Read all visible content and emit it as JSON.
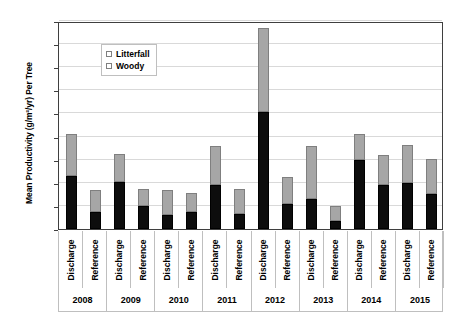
{
  "chart_data": {
    "type": "bar",
    "subtype": "stacked-column",
    "title": "",
    "xlabel": "",
    "ylabel": "Mean Productivity (g/m²/yr) Per Tree",
    "ylim": [
      0,
      180
    ],
    "ytick_step": 20,
    "yticks": [
      0,
      20,
      40,
      60,
      80,
      100,
      120,
      140,
      160,
      180
    ],
    "ytick_labels": [
      "0",
      "20",
      "40",
      "60",
      "80",
      "100",
      "120",
      "140",
      "160",
      "180"
    ],
    "grid": true,
    "grid_axis": "y",
    "legend": {
      "position": "upper-left-inside",
      "entries": [
        {
          "name": "Litterfall",
          "color": "#a6a6a6"
        },
        {
          "name": "Woody",
          "color": "#0d0d0d"
        }
      ]
    },
    "groups": [
      "2008",
      "2009",
      "2010",
      "2011",
      "2012",
      "2013",
      "2014",
      "2015"
    ],
    "categories": [
      "Discharge",
      "Reference",
      "Discharge",
      "Reference",
      "Discharge",
      "Reference",
      "Discharge",
      "Reference",
      "Discharge",
      "Reference",
      "Discharge",
      "Reference",
      "Discharge",
      "Reference",
      "Discharge",
      "Reference"
    ],
    "series": [
      {
        "name": "Woody",
        "color": "#0d0d0d",
        "values": [
          46,
          15,
          41,
          20,
          12,
          15,
          38,
          13,
          101,
          22,
          26,
          7,
          60,
          38,
          40,
          30
        ]
      },
      {
        "name": "Litterfall",
        "color": "#a6a6a6",
        "values": [
          36,
          19,
          24,
          15,
          22,
          16,
          34,
          22,
          73,
          23,
          46,
          13,
          22,
          26,
          33,
          31
        ]
      }
    ],
    "totals": [
      82,
      34,
      65,
      35,
      34,
      31,
      72,
      35,
      174,
      45,
      72,
      20,
      82,
      64,
      73,
      61
    ],
    "bars": [
      {
        "group": "2008",
        "category": "Discharge",
        "woody": 46,
        "litterfall": 36,
        "total": 82
      },
      {
        "group": "2008",
        "category": "Reference",
        "woody": 15,
        "litterfall": 19,
        "total": 34
      },
      {
        "group": "2009",
        "category": "Discharge",
        "woody": 41,
        "litterfall": 24,
        "total": 65
      },
      {
        "group": "2009",
        "category": "Reference",
        "woody": 20,
        "litterfall": 15,
        "total": 35
      },
      {
        "group": "2010",
        "category": "Discharge",
        "woody": 12,
        "litterfall": 22,
        "total": 34
      },
      {
        "group": "2010",
        "category": "Reference",
        "woody": 15,
        "litterfall": 16,
        "total": 31
      },
      {
        "group": "2011",
        "category": "Discharge",
        "woody": 38,
        "litterfall": 34,
        "total": 72
      },
      {
        "group": "2011",
        "category": "Reference",
        "woody": 13,
        "litterfall": 22,
        "total": 35
      },
      {
        "group": "2012",
        "category": "Discharge",
        "woody": 101,
        "litterfall": 73,
        "total": 174
      },
      {
        "group": "2012",
        "category": "Reference",
        "woody": 22,
        "litterfall": 23,
        "total": 45
      },
      {
        "group": "2013",
        "category": "Discharge",
        "woody": 26,
        "litterfall": 46,
        "total": 72
      },
      {
        "group": "2013",
        "category": "Reference",
        "woody": 7,
        "litterfall": 13,
        "total": 20
      },
      {
        "group": "2014",
        "category": "Discharge",
        "woody": 60,
        "litterfall": 22,
        "total": 82
      },
      {
        "group": "2014",
        "category": "Reference",
        "woody": 38,
        "litterfall": 26,
        "total": 64
      },
      {
        "group": "2015",
        "category": "Discharge",
        "woody": 40,
        "litterfall": 33,
        "total": 73
      },
      {
        "group": "2015",
        "category": "Reference",
        "woody": 30,
        "litterfall": 31,
        "total": 61
      }
    ]
  },
  "colors": {
    "litterfall": "#a6a6a6",
    "woody": "#0d0d0d",
    "gridline": "#d9d9d9",
    "plot_border": "#3f3f3f",
    "background": "#ffffff"
  }
}
